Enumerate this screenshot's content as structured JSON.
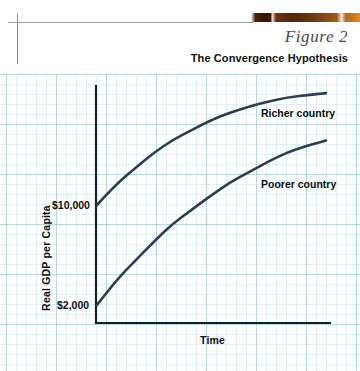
{
  "page": {
    "figure_label": "Figure 2",
    "figure_title": "The Convergence Hypothesis"
  },
  "chart_data": {
    "type": "line",
    "title": "The Convergence Hypothesis",
    "xlabel": "Time",
    "ylabel": "Real GDP per Capita",
    "grid": true,
    "legend_position": "inline-annotation",
    "ytick_labels": [
      "$10,000",
      "$2,000"
    ],
    "ytick_values": [
      10000,
      2000
    ],
    "xtick_labels": [],
    "annotations": [
      "Richer country",
      "Poorer country"
    ],
    "series": [
      {
        "name": "Richer country",
        "color": "#2c3e56",
        "start_value": 10000,
        "points": [
          [
            0,
            10000
          ],
          [
            0.08,
            11600
          ],
          [
            0.17,
            13000
          ],
          [
            0.25,
            14200
          ],
          [
            0.33,
            15200
          ],
          [
            0.42,
            16050
          ],
          [
            0.5,
            16800
          ],
          [
            0.58,
            17400
          ],
          [
            0.67,
            17900
          ],
          [
            0.75,
            18300
          ],
          [
            0.83,
            18600
          ],
          [
            0.92,
            18800
          ],
          [
            1.0,
            18950
          ]
        ]
      },
      {
        "name": "Poorer country",
        "color": "#2c3e56",
        "start_value": 2000,
        "points": [
          [
            0,
            2000
          ],
          [
            0.08,
            3900
          ],
          [
            0.17,
            5600
          ],
          [
            0.25,
            7100
          ],
          [
            0.33,
            8500
          ],
          [
            0.42,
            9700
          ],
          [
            0.5,
            10800
          ],
          [
            0.58,
            11800
          ],
          [
            0.67,
            12700
          ],
          [
            0.75,
            13500
          ],
          [
            0.83,
            14200
          ],
          [
            0.92,
            14750
          ],
          [
            1.0,
            15150
          ]
        ]
      }
    ]
  }
}
